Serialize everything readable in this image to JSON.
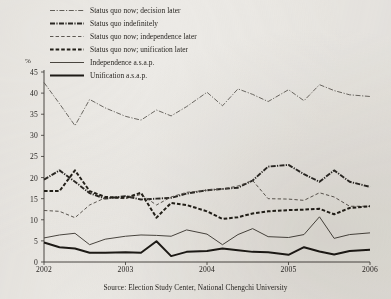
{
  "figure": {
    "y_axis_unit": "%",
    "caption": "Source: Election Study Center, National Chengchi University"
  },
  "legend": {
    "items": [
      {
        "label": "Status quo now; decision later",
        "style": "dash-dot-thin",
        "color": "#55514b"
      },
      {
        "label": "Status quo indefinitely",
        "style": "dash-dot-bold",
        "color": "#2b2824"
      },
      {
        "label": "Status quo now; independence later",
        "style": "dash-short",
        "color": "#5d5852"
      },
      {
        "label": "Status quo now; unification later",
        "style": "dash-bold",
        "color": "#232019"
      },
      {
        "label": "Independence a.s.a.p.",
        "style": "solid-thin",
        "color": "#4a4640"
      },
      {
        "label": "Unification a.s.a.p.",
        "style": "solid-bold",
        "color": "#1d1a16"
      }
    ]
  },
  "chart_data": {
    "type": "line",
    "title": "",
    "xlabel": "",
    "ylabel": "%",
    "ylim": [
      0,
      45
    ],
    "yticks": [
      0,
      5,
      10,
      15,
      20,
      25,
      30,
      35,
      40,
      45
    ],
    "xlim": [
      2002,
      2006
    ],
    "xticks": [
      2002,
      2003,
      2004,
      2005,
      2006
    ],
    "xtick_labels": [
      "2002",
      "2003",
      "2004",
      "2005",
      "2006"
    ],
    "grid": false,
    "legend_position": "top-left-above-plot",
    "x": [
      2002.0,
      2002.19,
      2002.38,
      2002.56,
      2002.75,
      2003.0,
      2003.19,
      2003.38,
      2003.56,
      2003.75,
      2004.0,
      2004.19,
      2004.38,
      2004.56,
      2004.75,
      2005.0,
      2005.19,
      2005.38,
      2005.56,
      2005.75,
      2006.0
    ],
    "series": [
      {
        "name": "Status quo now; decision later",
        "style": "dash-dot-thin",
        "values": [
          42.5,
          37.5,
          32.3,
          38.5,
          36.5,
          34.5,
          33.6,
          36.0,
          34.6,
          36.8,
          40.2,
          37.0,
          41.0,
          39.7,
          38.0,
          40.8,
          38.2,
          42.0,
          40.6,
          39.6,
          39.2
        ]
      },
      {
        "name": "Status quo indefinitely",
        "style": "dash-dot-bold",
        "values": [
          19.5,
          21.7,
          19.0,
          16.3,
          15.0,
          15.6,
          14.8,
          15.0,
          15.2,
          16.2,
          17.0,
          17.3,
          17.6,
          19.3,
          22.6,
          23.0,
          20.8,
          19.0,
          21.7,
          19.0,
          17.8
        ]
      },
      {
        "name": "Status quo now; independence later",
        "style": "dash-short",
        "values": [
          12.2,
          12.0,
          10.5,
          13.5,
          15.2,
          15.0,
          16.0,
          13.5,
          15.4,
          16.5,
          17.0,
          17.3,
          18.0,
          19.3,
          15.0,
          14.9,
          14.6,
          16.4,
          15.4,
          13.2,
          13.2
        ]
      },
      {
        "name": "Status quo now; unification later",
        "style": "dash-bold",
        "values": [
          16.8,
          16.8,
          21.7,
          16.8,
          15.4,
          15.2,
          16.4,
          10.5,
          14.0,
          13.5,
          12.0,
          10.2,
          10.6,
          11.5,
          12.0,
          12.3,
          12.4,
          12.6,
          11.3,
          12.8,
          13.2
        ]
      },
      {
        "name": "Independence a.s.a.p.",
        "style": "solid-thin",
        "values": [
          5.7,
          6.4,
          6.8,
          4.1,
          5.4,
          6.1,
          6.4,
          6.3,
          6.1,
          7.6,
          6.6,
          4.1,
          6.5,
          7.9,
          6.0,
          5.8,
          6.5,
          10.7,
          5.6,
          6.5,
          6.9
        ]
      },
      {
        "name": "Unification a.s.a.p.",
        "style": "solid-bold",
        "values": [
          4.6,
          3.5,
          3.2,
          2.2,
          2.2,
          2.3,
          2.2,
          4.9,
          1.4,
          2.4,
          2.6,
          3.2,
          2.8,
          2.4,
          2.3,
          1.7,
          3.5,
          2.5,
          1.8,
          2.6,
          2.9
        ]
      }
    ]
  }
}
